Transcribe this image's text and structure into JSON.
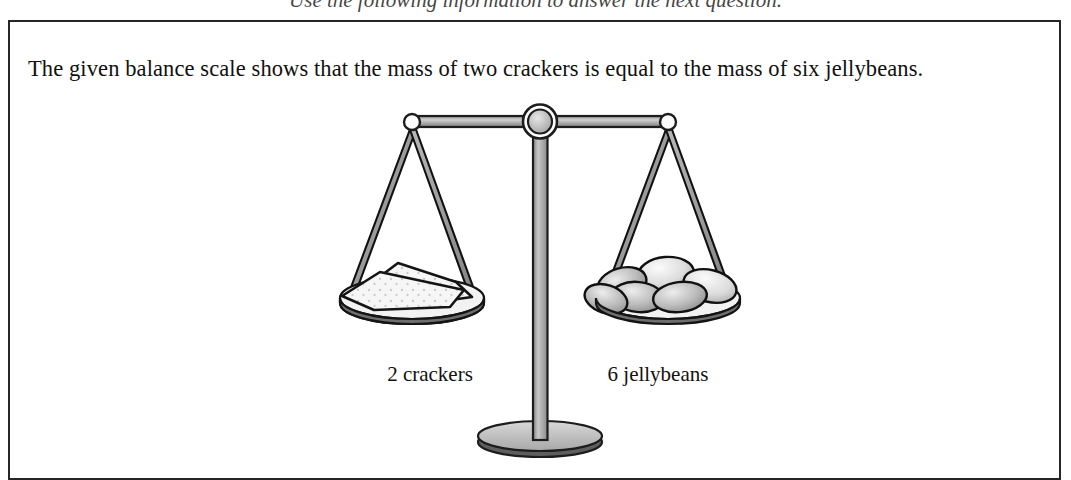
{
  "document": {
    "instruction": "Use the following information to answer the next question.",
    "prompt": "The given balance scale shows that the mass of two crackers is equal to the mass of six jellybeans."
  },
  "figure": {
    "name": "balance-scale",
    "state": "balanced",
    "left_pan": {
      "caption": "2 crackers",
      "count": 2,
      "item": "crackers"
    },
    "right_pan": {
      "caption": "6 jellybeans",
      "count": 6,
      "item": "jellybeans"
    }
  },
  "colors": {
    "ink": "#000000",
    "border": "#262626",
    "metal_light": "#d0d0d0",
    "metal_mid": "#9a9a9a",
    "metal_dark": "#6b6b6b",
    "pan_shadow": "#7a7a7a",
    "cracker_fill": "#f4f4f4",
    "jellybean_light": "#e3e3e3",
    "jellybean_mid": "#b4b4b4",
    "jellybean_dark": "#8e8e8e",
    "page": "#ffffff"
  }
}
